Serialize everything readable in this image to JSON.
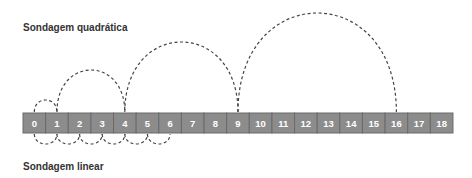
{
  "titles": {
    "quadratic": "Sondagem quadrática",
    "linear": "Sondagem linear"
  },
  "cells": [
    "0",
    "1",
    "2",
    "3",
    "4",
    "5",
    "6",
    "7",
    "8",
    "9",
    "10",
    "11",
    "12",
    "13",
    "14",
    "15",
    "16",
    "17",
    "18"
  ],
  "colors": {
    "cell_fill": "#8c8c8c",
    "cell_border": "#6a6a6a",
    "cell_text": "#ffffff",
    "arc": "#444444",
    "title": "#333333"
  },
  "quadratic_probes": [
    {
      "from": 0,
      "to": 1
    },
    {
      "from": 1,
      "to": 4
    },
    {
      "from": 4,
      "to": 9
    },
    {
      "from": 9,
      "to": 16
    }
  ],
  "linear_probes": [
    {
      "from": 0,
      "to": 1
    },
    {
      "from": 1,
      "to": 2
    },
    {
      "from": 2,
      "to": 3
    },
    {
      "from": 3,
      "to": 4
    },
    {
      "from": 4,
      "to": 5
    },
    {
      "from": 5,
      "to": 6
    }
  ]
}
